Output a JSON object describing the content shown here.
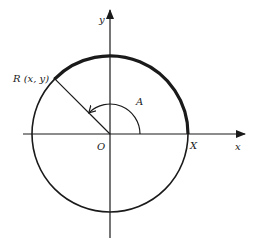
{
  "diagram": {
    "type": "unit-circle-angle",
    "labels": {
      "y_axis": "y",
      "x_axis": "x",
      "origin": "O",
      "x_intercept": "X",
      "point": "R (x, y)",
      "angle": "A"
    },
    "colors": {
      "stroke": "#1a1a1a",
      "background": "#ffffff"
    },
    "geometry": {
      "center": [
        110,
        134
      ],
      "radius": 78,
      "angle_degrees": 135,
      "angle_arc_radius": 30
    }
  }
}
